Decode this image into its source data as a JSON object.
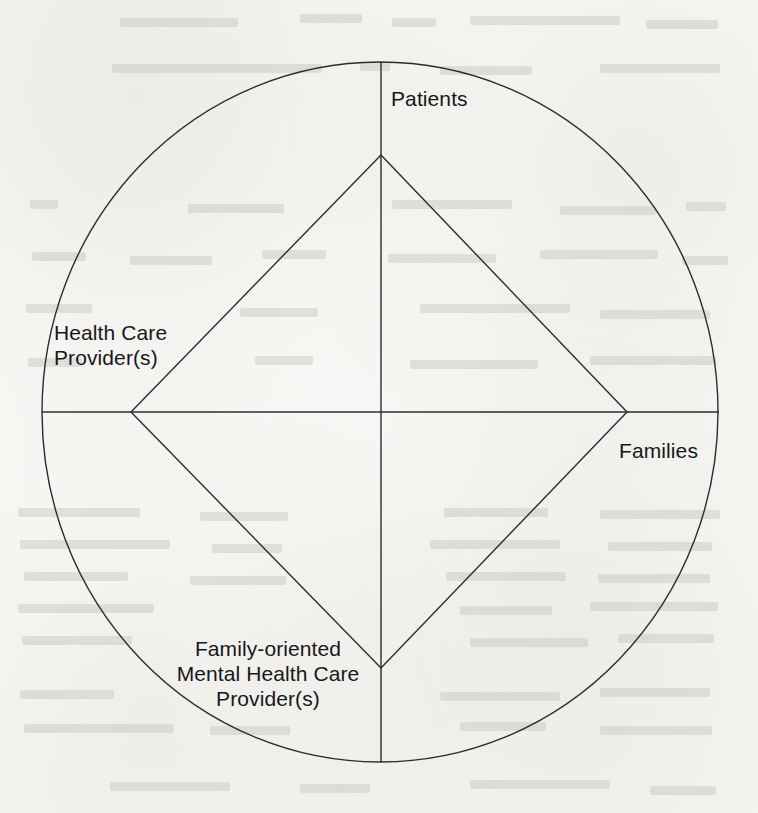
{
  "figure": {
    "type": "venn-like-relationship-diagram",
    "background_color": "#faf9f7",
    "stroke_color": "#2b2c2e"
  },
  "labels": {
    "top": "Patients",
    "left_line1": "Health Care",
    "left_line2": "Provider(s)",
    "right": "Families",
    "bottom_line1": "Family-oriented",
    "bottom_line2": "Mental Health Care",
    "bottom_line3": "Provider(s)"
  },
  "geometry": {
    "circle": {
      "cx": 380,
      "cy": 412,
      "rx": 338,
      "ry": 350
    },
    "diamond": {
      "top": {
        "x": 381,
        "y": 155
      },
      "right": {
        "x": 627,
        "y": 412
      },
      "bottom": {
        "x": 381,
        "y": 668
      },
      "left": {
        "x": 131,
        "y": 412
      }
    },
    "vertical_axis": {
      "x": 381,
      "y1": 62,
      "y2": 762
    },
    "horizontal_axis": {
      "y": 412,
      "x1": 42,
      "x2": 719
    }
  },
  "ghost_marks": [
    {
      "x": 120,
      "y": 18,
      "w": 118
    },
    {
      "x": 300,
      "y": 14,
      "w": 62
    },
    {
      "x": 392,
      "y": 18,
      "w": 44
    },
    {
      "x": 470,
      "y": 16,
      "w": 150
    },
    {
      "x": 646,
      "y": 20,
      "w": 72
    },
    {
      "x": 112,
      "y": 64,
      "w": 210
    },
    {
      "x": 360,
      "y": 62,
      "w": 30
    },
    {
      "x": 440,
      "y": 66,
      "w": 92
    },
    {
      "x": 600,
      "y": 64,
      "w": 120
    },
    {
      "x": 30,
      "y": 200,
      "w": 28
    },
    {
      "x": 188,
      "y": 204,
      "w": 96
    },
    {
      "x": 392,
      "y": 200,
      "w": 120
    },
    {
      "x": 560,
      "y": 206,
      "w": 96
    },
    {
      "x": 686,
      "y": 202,
      "w": 40
    },
    {
      "x": 32,
      "y": 252,
      "w": 54
    },
    {
      "x": 130,
      "y": 256,
      "w": 82
    },
    {
      "x": 262,
      "y": 250,
      "w": 64
    },
    {
      "x": 388,
      "y": 254,
      "w": 108
    },
    {
      "x": 540,
      "y": 250,
      "w": 118
    },
    {
      "x": 682,
      "y": 256,
      "w": 46
    },
    {
      "x": 26,
      "y": 304,
      "w": 66
    },
    {
      "x": 240,
      "y": 308,
      "w": 78
    },
    {
      "x": 420,
      "y": 304,
      "w": 150
    },
    {
      "x": 600,
      "y": 310,
      "w": 110
    },
    {
      "x": 28,
      "y": 358,
      "w": 54
    },
    {
      "x": 255,
      "y": 356,
      "w": 58
    },
    {
      "x": 410,
      "y": 360,
      "w": 128
    },
    {
      "x": 590,
      "y": 356,
      "w": 126
    },
    {
      "x": 18,
      "y": 508,
      "w": 122
    },
    {
      "x": 200,
      "y": 512,
      "w": 88
    },
    {
      "x": 444,
      "y": 508,
      "w": 104
    },
    {
      "x": 600,
      "y": 510,
      "w": 120
    },
    {
      "x": 20,
      "y": 540,
      "w": 150
    },
    {
      "x": 212,
      "y": 544,
      "w": 70
    },
    {
      "x": 430,
      "y": 540,
      "w": 130
    },
    {
      "x": 608,
      "y": 542,
      "w": 104
    },
    {
      "x": 24,
      "y": 572,
      "w": 104
    },
    {
      "x": 190,
      "y": 576,
      "w": 96
    },
    {
      "x": 446,
      "y": 572,
      "w": 120
    },
    {
      "x": 598,
      "y": 574,
      "w": 112
    },
    {
      "x": 18,
      "y": 604,
      "w": 136
    },
    {
      "x": 460,
      "y": 606,
      "w": 92
    },
    {
      "x": 590,
      "y": 602,
      "w": 128
    },
    {
      "x": 22,
      "y": 636,
      "w": 110
    },
    {
      "x": 470,
      "y": 638,
      "w": 118
    },
    {
      "x": 618,
      "y": 634,
      "w": 96
    },
    {
      "x": 20,
      "y": 690,
      "w": 94
    },
    {
      "x": 440,
      "y": 692,
      "w": 120
    },
    {
      "x": 600,
      "y": 688,
      "w": 110
    },
    {
      "x": 24,
      "y": 724,
      "w": 150
    },
    {
      "x": 210,
      "y": 726,
      "w": 80
    },
    {
      "x": 460,
      "y": 722,
      "w": 86
    },
    {
      "x": 600,
      "y": 726,
      "w": 112
    },
    {
      "x": 110,
      "y": 782,
      "w": 120
    },
    {
      "x": 300,
      "y": 784,
      "w": 70
    },
    {
      "x": 470,
      "y": 780,
      "w": 140
    },
    {
      "x": 650,
      "y": 786,
      "w": 66
    }
  ]
}
